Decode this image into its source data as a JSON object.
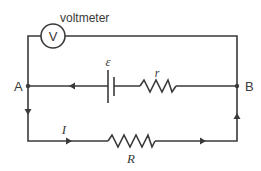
{
  "diagram": {
    "type": "circuit",
    "voltmeter": {
      "label": "voltmeter",
      "symbol": "V"
    },
    "nodes": {
      "left": "A",
      "right": "B"
    },
    "cell": {
      "emf_label": "ε"
    },
    "internal_resistance": {
      "label": "r"
    },
    "external_resistor": {
      "label": "R"
    },
    "current": {
      "label": "I"
    },
    "colors": {
      "wire": "#3a3a3a",
      "background": "#ffffff"
    }
  }
}
